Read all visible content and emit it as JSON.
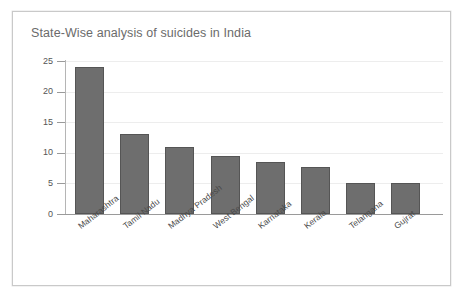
{
  "chart_data": {
    "type": "bar",
    "title": "State-Wise analysis of suicides in India",
    "xlabel": "",
    "ylabel": "",
    "categories": [
      "Maharashtra",
      "Tamil Nadu",
      "Madhya Pradesh",
      "West Bengal",
      "Karnataka",
      "Kerala",
      "Telangana",
      "Gujrat"
    ],
    "values": [
      24,
      13,
      11,
      9.5,
      8.5,
      7.7,
      5.1,
      5.1
    ],
    "ylim": [
      0,
      25
    ],
    "yticks": [
      0,
      5,
      10,
      15,
      20,
      25
    ],
    "ytick_labels": [
      "0",
      "5",
      "10",
      "15",
      "20",
      "25"
    ],
    "grid": true,
    "legend": false,
    "bar_color": "#6e6e6e",
    "bar_border_color": "#555555",
    "grid_color": "#ededed",
    "axis_color": "#9a9a9a",
    "title_color": "#6b6b6b",
    "background": "#ffffff",
    "frame_border_color": "#c9c9c9"
  }
}
